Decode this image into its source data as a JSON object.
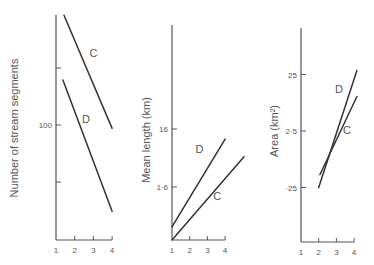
{
  "chart_data": [
    {
      "type": "line",
      "title": "",
      "xlabel": "",
      "ylabel": "Number of stream segments",
      "yscale": "log",
      "xlim": [
        1,
        4
      ],
      "x_ticks": [
        "1",
        "2",
        "3",
        "4"
      ],
      "y_ticks": [
        {
          "value": 200,
          "label": ""
        },
        {
          "value": 100,
          "label": "100"
        },
        {
          "value": 50,
          "label": ""
        }
      ],
      "ylim": [
        15,
        380
      ],
      "grid": false,
      "series": [
        {
          "name": "C",
          "x": [
            1.43,
            4.0
          ],
          "y": [
            380,
            96
          ]
        },
        {
          "name": "D",
          "x": [
            1.37,
            4.0
          ],
          "y": [
            173,
            35
          ]
        }
      ],
      "series_labels": [
        {
          "text": "C",
          "x": 3.0,
          "y": 230
        },
        {
          "text": "D",
          "x": 2.6,
          "y": 103
        }
      ]
    },
    {
      "type": "line",
      "title": "",
      "xlabel": "",
      "ylabel": "Mean length (km)",
      "yscale": "log",
      "xlim": [
        1,
        4
      ],
      "x_ticks": [
        "1",
        "2",
        "3",
        "4"
      ],
      "y_ticks": [
        {
          "value": 16,
          "label": "16"
        },
        {
          "value": 1.6,
          "label": "1·6"
        }
      ],
      "ylim": [
        0.195,
        230
      ],
      "grid": false,
      "series": [
        {
          "name": "D",
          "x": [
            1.0,
            4.0
          ],
          "y": [
            0.33,
            10.7
          ]
        },
        {
          "name": "C",
          "x": [
            1.0,
            5.07
          ],
          "y": [
            0.195,
            5.3
          ]
        }
      ],
      "series_labels": [
        {
          "text": "D",
          "x": 2.55,
          "y": 6.2
        },
        {
          "text": "C",
          "x": 3.55,
          "y": 0.95
        }
      ]
    },
    {
      "type": "line",
      "title": "",
      "xlabel": "",
      "ylabel": "Area (km²)",
      "yscale": "log",
      "xlim": [
        1,
        4
      ],
      "x_ticks": [
        "1",
        "2",
        "3",
        "4"
      ],
      "y_ticks": [
        {
          "value": 25,
          "label": "25"
        },
        {
          "value": 2.5,
          "label": "2·5"
        },
        {
          "value": 0.25,
          "label": "·25"
        }
      ],
      "ylim": [
        0.025,
        180
      ],
      "grid": false,
      "series": [
        {
          "name": "D",
          "x": [
            2.0,
            4.16
          ],
          "y": [
            0.25,
            29.4
          ]
        },
        {
          "name": "C",
          "x": [
            2.07,
            4.16
          ],
          "y": [
            0.42,
            10.2
          ]
        }
      ],
      "series_labels": [
        {
          "text": "D",
          "x": 3.15,
          "y": 12.0
        },
        {
          "text": "C",
          "x": 3.6,
          "y": 2.2
        }
      ]
    }
  ]
}
